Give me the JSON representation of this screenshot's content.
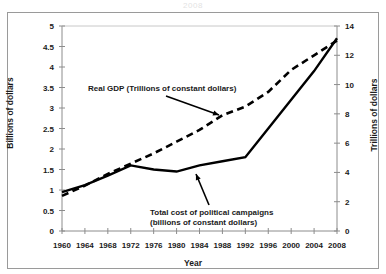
{
  "figure": {
    "top_cut_text": "2008",
    "xlabel": "Year",
    "ylabel_left": "Billions of dollars",
    "ylabel_right": "Trillions of dollars",
    "annotation_gdp": "Real GDP (Trillions of constant dollars)",
    "annotation_campaigns_line1": "Total cost of political campaigns",
    "annotation_campaigns_line2": "(billions of constant dollars)",
    "colors": {
      "line": "#000000",
      "axis": "#8c8c8c",
      "frame": "#9a9a9a",
      "background": "#ffffff",
      "text": "#1a1a1a"
    }
  },
  "chart_data": {
    "type": "line",
    "title": "",
    "xlabel": "Year",
    "grid": false,
    "legend": "annotations",
    "x": [
      1960,
      1964,
      1968,
      1972,
      1976,
      1980,
      1984,
      1988,
      1992,
      1996,
      2000,
      2004,
      2008
    ],
    "xtick_labels": [
      "1960",
      "1964",
      "1968",
      "1972",
      "1976",
      "1980",
      "1984",
      "1988",
      "1992",
      "1996",
      "2000",
      "2004",
      "2008"
    ],
    "xlim": [
      1960,
      2008
    ],
    "axes": [
      {
        "id": "left",
        "label": "Billions of dollars",
        "lim": [
          0,
          5
        ],
        "ticks": [
          0,
          0.5,
          1,
          1.5,
          2,
          2.5,
          3,
          3.5,
          4,
          4.5,
          5
        ],
        "tick_labels": [
          "0",
          "0.5",
          "1",
          "1.5",
          "2",
          "2.5",
          "3",
          "3.5",
          "4",
          "4.5",
          "5"
        ]
      },
      {
        "id": "right",
        "label": "Trillions of dollars",
        "lim": [
          0,
          14
        ],
        "ticks": [
          0,
          2,
          4,
          6,
          8,
          10,
          12,
          14
        ],
        "tick_labels": [
          "0",
          "2",
          "4",
          "6",
          "8",
          "10",
          "12",
          "14"
        ]
      }
    ],
    "series": [
      {
        "name": "Total cost of political campaigns (billions of constant dollars)",
        "axis": "left",
        "style": "solid",
        "values": [
          0.95,
          1.12,
          1.35,
          1.6,
          1.5,
          1.45,
          1.6,
          1.7,
          1.8,
          2.5,
          3.2,
          3.9,
          4.7
        ]
      },
      {
        "name": "Real GDP (Trillions of constant dollars)",
        "axis": "right",
        "style": "dashed",
        "values": [
          2.4,
          3.1,
          3.9,
          4.6,
          5.3,
          6.1,
          6.9,
          7.9,
          8.5,
          9.5,
          11.0,
          12.0,
          13.0
        ]
      }
    ],
    "annotations": [
      {
        "text": "Real GDP (Trillions of constant dollars)",
        "points_to_series": "Real GDP (Trillions of constant dollars)",
        "arrow": "down-right"
      },
      {
        "text": "Total cost of political campaigns (billions of constant dollars)",
        "points_to_series": "Total cost of political campaigns (billions of constant dollars)",
        "arrow": "up-left"
      }
    ]
  }
}
